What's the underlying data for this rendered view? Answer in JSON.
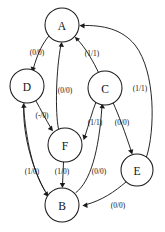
{
  "diagram": {
    "kind": "state-transition-diagram",
    "background_color": "#ffffff",
    "stroke_color": "#1a1a1a",
    "text_color": "#111111",
    "node_radius": 17,
    "nodes": [
      {
        "id": "A",
        "label": "A",
        "cx": 62,
        "cy": 25,
        "r": 17
      },
      {
        "id": "D",
        "label": "D",
        "cx": 27,
        "cy": 86,
        "r": 17
      },
      {
        "id": "C",
        "label": "C",
        "cx": 105,
        "cy": 88,
        "r": 17
      },
      {
        "id": "F",
        "label": "F",
        "cx": 65,
        "cy": 145,
        "r": 17
      },
      {
        "id": "E",
        "label": "E",
        "cx": 137,
        "cy": 170,
        "r": 16
      },
      {
        "id": "B",
        "label": "B",
        "cx": 62,
        "cy": 205,
        "r": 17
      }
    ],
    "edges": [
      {
        "id": "A-D",
        "from": "A",
        "to": "D",
        "label": "(0/0)",
        "label_x": 37,
        "label_y": 52
      },
      {
        "id": "C-A",
        "from": "C",
        "to": "A",
        "label": "(1/1)",
        "label_x": 92,
        "label_y": 53
      },
      {
        "id": "F-A",
        "from": "F",
        "to": "A",
        "label": "(0/0)",
        "label_x": 65,
        "label_y": 90
      },
      {
        "id": "E-A",
        "from": "E",
        "to": "A",
        "label": "(1/1)",
        "label_x": 140,
        "label_y": 88
      },
      {
        "id": "D-F",
        "from": "D",
        "to": "F",
        "label": "(-/0)",
        "label_x": 42,
        "label_y": 115
      },
      {
        "id": "C-F",
        "from": "C",
        "to": "F",
        "label": "(1/1)",
        "label_x": 95,
        "label_y": 122
      },
      {
        "id": "C-E",
        "from": "C",
        "to": "E",
        "label": "(0/0)",
        "label_x": 122,
        "label_y": 122
      },
      {
        "id": "D-B",
        "from": "D",
        "to": "B",
        "label": "(1/0)",
        "label_x": 32,
        "label_y": 171
      },
      {
        "id": "F-B",
        "from": "F",
        "to": "B",
        "label": "(1/0)",
        "label_x": 62,
        "label_y": 171
      },
      {
        "id": "B-C",
        "from": "B",
        "to": "C",
        "label": "(0/0)",
        "label_x": 99,
        "label_y": 171
      },
      {
        "id": "E-B",
        "from": "E",
        "to": "B",
        "label": "(0/0)",
        "label_x": 118,
        "label_y": 205
      }
    ]
  }
}
